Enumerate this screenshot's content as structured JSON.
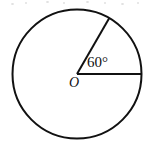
{
  "figure": {
    "kind": "geometry-diagram",
    "background_color": "#ffffff",
    "stroke_color": "#111111",
    "stroke_width": 2
  },
  "circle": {
    "center_x": 77,
    "center_y": 74,
    "radius": 64.5
  },
  "center_point": {
    "label": "O",
    "x": 77,
    "y": 74
  },
  "angle": {
    "label": "60°",
    "value": 60,
    "unit": "degrees",
    "vertex": "O"
  },
  "radii": [
    {
      "name": "horizontal-radius",
      "from_x": 77,
      "from_y": 74,
      "to_x": 141.5,
      "to_y": 74,
      "angle_from_horizontal": 0
    },
    {
      "name": "slanted-radius",
      "from_x": 77,
      "from_y": 74,
      "to_x": 109.3,
      "to_y": 18.1,
      "angle_from_horizontal": 60
    }
  ],
  "artifacts": {
    "note": "faint scanner specks along top edge",
    "specks": [
      {
        "x": 11,
        "y": 3,
        "w": 3,
        "h": 2
      },
      {
        "x": 25,
        "y": 2,
        "w": 2,
        "h": 2
      },
      {
        "x": 46,
        "y": 1,
        "w": 3,
        "h": 2
      },
      {
        "x": 63,
        "y": 2,
        "w": 2,
        "h": 2
      },
      {
        "x": 86,
        "y": 1,
        "w": 3,
        "h": 2
      },
      {
        "x": 104,
        "y": 2,
        "w": 2,
        "h": 2
      },
      {
        "x": 121,
        "y": 3,
        "w": 3,
        "h": 2
      },
      {
        "x": 137,
        "y": 2,
        "w": 2,
        "h": 2
      }
    ]
  }
}
